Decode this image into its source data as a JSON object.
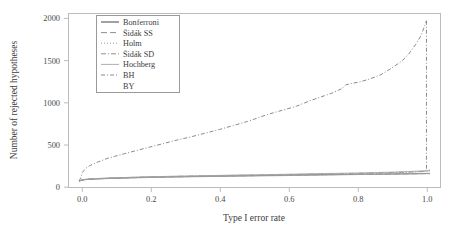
{
  "chart_data": {
    "type": "line",
    "title": "",
    "xlabel": "Type I error rate",
    "ylabel": "Number of rejected hypotheses",
    "xlim": [
      -0.03,
      1.03
    ],
    "ylim": [
      -80,
      2080
    ],
    "grid": false,
    "legend_position": "top-left",
    "xticks": [
      0.0,
      0.2,
      0.4,
      0.6,
      0.8,
      1.0
    ],
    "xtick_labels": [
      "0.0",
      "0.2",
      "0.4",
      "0.6",
      "0.8",
      "1.0"
    ],
    "yticks": [
      0,
      500,
      1000,
      1500,
      2000
    ],
    "ytick_labels": [
      "0",
      "500",
      "1000",
      "1500",
      "2000"
    ],
    "series": [
      {
        "name": "Bonferroni",
        "dash": "none",
        "color": "#8a8a8a",
        "width": 1.0,
        "x": [
          0.0,
          0.01,
          0.02,
          0.05,
          0.1,
          0.15,
          0.2,
          0.25,
          0.3,
          0.35,
          0.4,
          0.45,
          0.5,
          0.55,
          0.6,
          0.65,
          0.7,
          0.75,
          0.8,
          0.85,
          0.9,
          0.95,
          0.98,
          0.99,
          0.995,
          1.0
        ],
        "values": [
          0,
          14,
          20,
          28,
          36,
          42,
          47,
          51,
          55,
          58,
          61,
          64,
          67,
          70,
          73,
          76,
          79,
          81,
          84,
          86,
          88,
          90,
          91,
          92,
          92,
          92
        ]
      },
      {
        "name": "Šidák SS",
        "dash": "6,3",
        "color": "#8f8f8f",
        "width": 1.0,
        "x": [
          0.0,
          0.01,
          0.02,
          0.05,
          0.1,
          0.15,
          0.2,
          0.25,
          0.3,
          0.35,
          0.4,
          0.45,
          0.5,
          0.55,
          0.6,
          0.65,
          0.7,
          0.75,
          0.8,
          0.85,
          0.9,
          0.95,
          0.98,
          0.99,
          0.995,
          1.0
        ],
        "values": [
          0,
          14,
          20,
          28,
          36,
          42,
          47,
          52,
          55,
          59,
          62,
          65,
          68,
          71,
          74,
          77,
          80,
          82,
          85,
          87,
          89,
          91,
          92,
          93,
          93,
          93
        ]
      },
      {
        "name": "Holm",
        "dash": "1,2",
        "color": "#9a9a9a",
        "width": 1.0,
        "x": [
          0.0,
          0.01,
          0.02,
          0.05,
          0.1,
          0.15,
          0.2,
          0.25,
          0.3,
          0.35,
          0.4,
          0.45,
          0.5,
          0.55,
          0.6,
          0.65,
          0.7,
          0.75,
          0.8,
          0.85,
          0.9,
          0.95,
          0.98,
          0.99,
          0.995,
          1.0
        ],
        "values": [
          0,
          15,
          21,
          30,
          38,
          45,
          50,
          55,
          59,
          63,
          66,
          70,
          73,
          76,
          80,
          83,
          87,
          90,
          94,
          98,
          103,
          110,
          116,
          120,
          122,
          124
        ]
      },
      {
        "name": "Šidák SD",
        "dash": "5,2,1,2",
        "color": "#8f8f8f",
        "width": 1.0,
        "x": [
          0.0,
          0.01,
          0.02,
          0.05,
          0.1,
          0.15,
          0.2,
          0.25,
          0.3,
          0.35,
          0.4,
          0.45,
          0.5,
          0.55,
          0.6,
          0.65,
          0.7,
          0.75,
          0.8,
          0.85,
          0.9,
          0.95,
          0.98,
          0.99,
          0.995,
          1.0
        ],
        "values": [
          0,
          15,
          21,
          30,
          38,
          45,
          51,
          56,
          60,
          64,
          67,
          71,
          74,
          78,
          81,
          85,
          89,
          92,
          96,
          101,
          106,
          113,
          119,
          123,
          125,
          127
        ]
      },
      {
        "name": "Hochberg",
        "dash": "none",
        "color": "#a5a5a5",
        "width": 0.9,
        "x": [
          0.0,
          0.01,
          0.02,
          0.05,
          0.1,
          0.15,
          0.2,
          0.25,
          0.3,
          0.35,
          0.4,
          0.45,
          0.5,
          0.55,
          0.6,
          0.65,
          0.7,
          0.75,
          0.8,
          0.85,
          0.9,
          0.95,
          0.98,
          0.99,
          0.995,
          1.0
        ],
        "values": [
          0,
          16,
          22,
          31,
          40,
          47,
          53,
          58,
          62,
          66,
          70,
          74,
          77,
          81,
          85,
          89,
          93,
          97,
          101,
          106,
          112,
          120,
          127,
          131,
          133,
          135
        ]
      },
      {
        "name": "BH",
        "dash": "4,2,1,2",
        "color": "#8a8a8a",
        "width": 1.0,
        "x": [
          0.0,
          0.005,
          0.01,
          0.02,
          0.03,
          0.05,
          0.08,
          0.1,
          0.13,
          0.16,
          0.2,
          0.24,
          0.28,
          0.32,
          0.36,
          0.4,
          0.44,
          0.48,
          0.5,
          0.54,
          0.58,
          0.62,
          0.66,
          0.68,
          0.7,
          0.72,
          0.75,
          0.76,
          0.78,
          0.8,
          0.83,
          0.86,
          0.89,
          0.92,
          0.94,
          0.96,
          0.975,
          0.985,
          0.99
        ],
        "values": [
          0,
          40,
          110,
          160,
          190,
          230,
          280,
          305,
          340,
          375,
          420,
          465,
          510,
          550,
          595,
          640,
          690,
          740,
          770,
          830,
          880,
          930,
          1000,
          1030,
          1060,
          1090,
          1150,
          1195,
          1215,
          1230,
          1270,
          1320,
          1400,
          1490,
          1580,
          1700,
          1810,
          1930,
          1990
        ]
      },
      {
        "name": "BY",
        "dash": "none",
        "color": "#9c9c9c",
        "width": 0.9,
        "x": [
          0.0,
          0.01,
          0.02,
          0.05,
          0.1,
          0.15,
          0.2,
          0.25,
          0.3,
          0.35,
          0.4,
          0.45,
          0.5,
          0.55,
          0.6,
          0.65,
          0.7,
          0.75,
          0.8,
          0.85,
          0.9,
          0.95,
          0.98,
          0.99,
          0.995,
          1.0
        ],
        "values": [
          0,
          13,
          18,
          26,
          33,
          39,
          44,
          48,
          52,
          55,
          58,
          61,
          64,
          66,
          69,
          72,
          75,
          78,
          81,
          84,
          87,
          91,
          94,
          96,
          96,
          97
        ]
      }
    ],
    "drop_line": {
      "name": "BH-terminal-drop",
      "x": 0.99,
      "from": 1990,
      "to": 130
    }
  },
  "legend": {
    "entries": [
      {
        "label": "Bonferroni"
      },
      {
        "label": "Šidák SS"
      },
      {
        "label": "Holm"
      },
      {
        "label": "Šidák SD"
      },
      {
        "label": "Hochberg"
      },
      {
        "label": "BH"
      },
      {
        "label": "BY"
      }
    ]
  }
}
